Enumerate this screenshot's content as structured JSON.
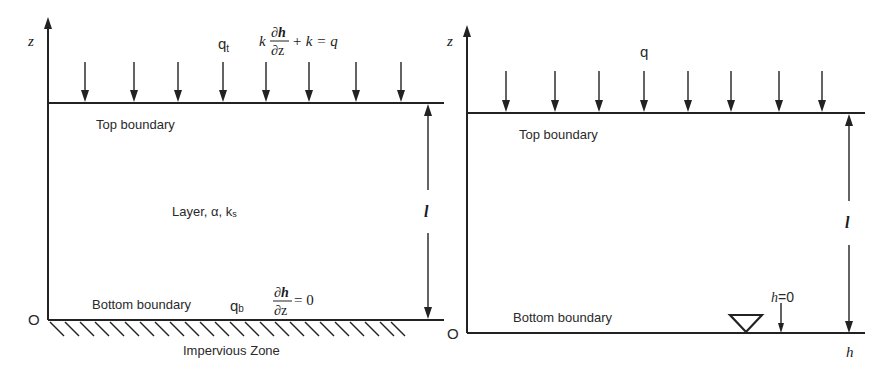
{
  "left_panel": {
    "axis_label": "z",
    "origin_label": "O",
    "flux_label": "q",
    "flux_subscript": "t",
    "top_bc": {
      "k": "k",
      "num": "∂h",
      "den": "∂z",
      "rest": "+ k = q"
    },
    "top_boundary_label": "Top boundary",
    "layer_label": "Layer, α, k",
    "layer_subscript": "s",
    "thickness_label": "l",
    "bottom_boundary_label": "Bottom boundary",
    "bottom_flux_label": "q",
    "bottom_flux_subscript": "b",
    "bottom_bc": {
      "num": "∂h",
      "den": "∂z",
      "rest": "= 0"
    },
    "ground_label": "Impervious Zone",
    "arrow_count": 8
  },
  "right_panel": {
    "axis_label": "z",
    "origin_label": "O",
    "flux_label": "q",
    "top_boundary_label": "Top boundary",
    "thickness_label": "l",
    "bottom_boundary_label": "Bottom boundary",
    "water_table_label_var": "h",
    "water_table_label_rest": "=0",
    "h_axis_label": "h",
    "arrow_count": 8
  },
  "colors": {
    "stroke": "#222222",
    "text": "#2a2a2a",
    "background": "#ffffff"
  }
}
